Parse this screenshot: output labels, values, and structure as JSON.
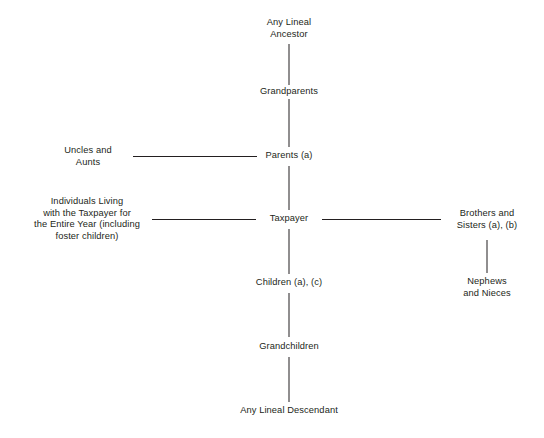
{
  "diagram": {
    "background_color": "#ffffff",
    "line_color": "#231f20",
    "text_color": "#231f20",
    "nodes": {
      "any_lineal_ancestor": "Any Lineal\nAncestor",
      "grandparents": "Grandparents",
      "parents": "Parents (a)",
      "uncles_and_aunts": "Uncles and\nAunts",
      "taxpayer": "Taxpayer",
      "individuals_living": "Individuals Living\nwith the Taxpayer for\nthe Entire Year (including\nfoster children)",
      "brothers_and_sisters": "Brothers and\nSisters (a), (b)",
      "nephews_and_nieces": "Nephews\nand Nieces",
      "children": "Children (a), (c)",
      "grandchildren": "Grandchildren",
      "any_lineal_descendant": "Any Lineal Descendant"
    }
  }
}
